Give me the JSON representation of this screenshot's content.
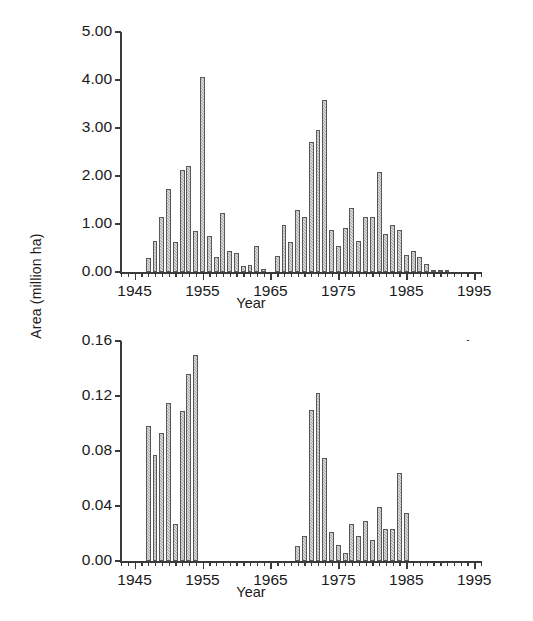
{
  "figure": {
    "shared_ylabel": "Area (million ha)",
    "background_color": "#ffffff",
    "bar_fill_color": "#a8a8a8",
    "bar_edge_color": "#585858",
    "axis_color": "#3a3a3a"
  },
  "panels": [
    {
      "tag": "a",
      "xlabel": "Year",
      "ylabel": "Area (million ha)",
      "ytick_labels": [
        "0.00",
        "1.00",
        "2.00",
        "3.00",
        "4.00",
        "5.00"
      ],
      "xtick_labels": [
        "1945",
        "1955",
        "1965",
        "1975",
        "1985",
        "1995"
      ]
    },
    {
      "tag": "b",
      "xlabel": "Year",
      "ylabel": "Area (million ha)",
      "ytick_labels": [
        "0.00",
        "0.04",
        "0.08",
        "0.12",
        "0.16"
      ],
      "xtick_labels": [
        "1945",
        "1955",
        "1965",
        "1975",
        "1985",
        "1995"
      ]
    }
  ],
  "chart_data": [
    {
      "type": "bar",
      "panel": "a",
      "title": "",
      "xlabel": "Year",
      "ylabel": "Area (million ha)",
      "xlim": [
        1943,
        1996
      ],
      "ylim": [
        0.0,
        5.0
      ],
      "yticks": [
        0.0,
        1.0,
        2.0,
        3.0,
        4.0,
        5.0
      ],
      "ytick_labels": [
        "0.00",
        "1.00",
        "2.00",
        "3.00",
        "4.00",
        "5.00"
      ],
      "xticks": [
        1945,
        1955,
        1965,
        1975,
        1985,
        1995
      ],
      "xtick_labels": [
        "1945",
        "1955",
        "1965",
        "1975",
        "1985",
        "1995"
      ],
      "xtick_minor_interval": 1,
      "grid": false,
      "legend": null,
      "categories": [
        1947,
        1948,
        1949,
        1950,
        1951,
        1952,
        1953,
        1954,
        1955,
        1956,
        1957,
        1958,
        1959,
        1960,
        1961,
        1962,
        1963,
        1964,
        1965,
        1966,
        1967,
        1968,
        1969,
        1970,
        1971,
        1972,
        1973,
        1974,
        1975,
        1976,
        1977,
        1978,
        1979,
        1980,
        1981,
        1982,
        1983,
        1984,
        1985,
        1986,
        1987,
        1988,
        1989,
        1990,
        1991
      ],
      "values": [
        0.3,
        0.64,
        1.15,
        1.73,
        0.63,
        2.13,
        2.2,
        0.86,
        4.06,
        0.76,
        0.32,
        1.22,
        0.44,
        0.39,
        0.12,
        0.14,
        0.54,
        0.06,
        0.0,
        0.33,
        0.97,
        0.62,
        1.29,
        1.14,
        2.7,
        2.96,
        3.58,
        0.87,
        0.55,
        0.92,
        1.34,
        0.65,
        1.15,
        1.15,
        2.09,
        0.79,
        0.97,
        0.88,
        0.36,
        0.43,
        0.32,
        0.16,
        0.05,
        0.05,
        0.02
      ]
    },
    {
      "type": "bar",
      "panel": "b",
      "title": "",
      "xlabel": "Year",
      "ylabel": "Area (million ha)",
      "xlim": [
        1943,
        1996
      ],
      "ylim": [
        0.0,
        0.16
      ],
      "yticks": [
        0.0,
        0.04,
        0.08,
        0.12,
        0.16
      ],
      "ytick_labels": [
        "0.00",
        "0.04",
        "0.08",
        "0.12",
        "0.16"
      ],
      "xticks": [
        1945,
        1955,
        1965,
        1975,
        1985,
        1995
      ],
      "xtick_labels": [
        "1945",
        "1955",
        "1965",
        "1975",
        "1985",
        "1995"
      ],
      "xtick_minor_interval": 1,
      "grid": false,
      "legend": null,
      "categories": [
        1947,
        1948,
        1949,
        1950,
        1951,
        1952,
        1953,
        1954,
        1969,
        1970,
        1971,
        1972,
        1973,
        1974,
        1975,
        1976,
        1977,
        1978,
        1979,
        1980,
        1981,
        1982,
        1983,
        1984,
        1985,
        1986
      ],
      "values": [
        0.098,
        0.077,
        0.093,
        0.115,
        0.027,
        0.109,
        0.136,
        0.15,
        0.011,
        0.018,
        0.11,
        0.122,
        0.075,
        0.021,
        0.012,
        0.006,
        0.027,
        0.018,
        0.029,
        0.015,
        0.039,
        0.023,
        0.023,
        0.064,
        0.035,
        0.0
      ]
    }
  ]
}
